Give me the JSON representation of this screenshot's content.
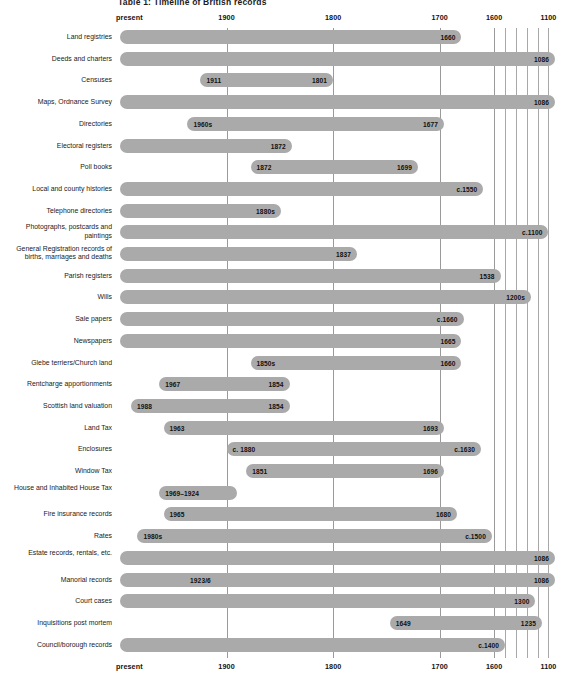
{
  "figure": {
    "title": "Table 1: Timeline of British records",
    "axis_labels_top": [
      "present",
      "1900",
      "1800",
      "1700",
      "1600",
      "1100"
    ],
    "axis_labels_bottom": [
      "present",
      "1900",
      "1800",
      "1700",
      "1600",
      "1100"
    ],
    "bar_color": "#aaaaaa",
    "gridline_color": "#9a9a9a"
  },
  "chart_data": {
    "type": "bar",
    "title": "Table 1: Timeline of British records",
    "xlabel": "",
    "ylabel": "",
    "orientation": "horizontal-timeline",
    "grid": true,
    "legend": "none",
    "axis_ticks": [
      {
        "label": "present",
        "pos": 0
      },
      {
        "label": "1900",
        "pos": 0.245
      },
      {
        "label": "1800",
        "pos": 0.49
      },
      {
        "label": "1700",
        "pos": 0.735
      },
      {
        "label": "1600",
        "pos": 0.86
      },
      {
        "label": "1100",
        "pos": 0.985
      }
    ],
    "minor_gridlines": [
      0.886,
      0.911,
      0.936,
      0.961,
      0.985
    ],
    "categories": [
      "Land registries",
      "Deeds and charters",
      "Censuses",
      "Maps, Ordnance Survey",
      "Directories",
      "Electoral registers",
      "Poll books",
      "Local and county histories",
      "Telephone directories",
      "Photographs, postcards and paintings",
      "General Registration records of births, marriages and deaths",
      "Parish registers",
      "Wills",
      "Sale papers",
      "Newspapers",
      "Glebe terriers/Church land",
      "Rentcharge apportionments",
      "Scottish land valuation",
      "Land Tax",
      "Enclosures",
      "Window Tax",
      "House and Inhabited House Tax",
      "Fire insurance records",
      "Rates",
      "Estate records, rentals, etc.",
      "Manorial records",
      "Court cases",
      "Inquisitions post mortem",
      "Council/borough records"
    ],
    "rows": [
      {
        "label": "Land registries",
        "start": 0.0,
        "end": 0.785,
        "start_value": "",
        "end_value": "1660"
      },
      {
        "label": "Deeds and charters",
        "start": 0.0,
        "end": 1.0,
        "start_value": "",
        "end_value": "1086"
      },
      {
        "label": "Censuses",
        "start": 0.185,
        "end": 0.49,
        "start_value": "1911",
        "end_value": "1801"
      },
      {
        "label": "Maps, Ordnance Survey",
        "start": 0.0,
        "end": 1.0,
        "start_value": "",
        "end_value": "1086"
      },
      {
        "label": "Directories",
        "start": 0.155,
        "end": 0.745,
        "start_value": "1960s",
        "end_value": "1677"
      },
      {
        "label": "Electoral registers",
        "start": 0.0,
        "end": 0.395,
        "start_value": "",
        "end_value": "1872"
      },
      {
        "label": "Poll books",
        "start": 0.3,
        "end": 0.685,
        "start_value": "1872",
        "end_value": "1699"
      },
      {
        "label": "Local and county histories",
        "start": 0.0,
        "end": 0.835,
        "start_value": "",
        "end_value": "c.1550"
      },
      {
        "label": "Telephone directories",
        "start": 0.0,
        "end": 0.37,
        "start_value": "",
        "end_value": "1880s"
      },
      {
        "label": "Photographs, postcards and paintings",
        "start": 0.0,
        "end": 0.985,
        "start_value": "",
        "end_value": "c.1100"
      },
      {
        "label": "General Registration records of births, marriages and deaths",
        "start": 0.0,
        "end": 0.545,
        "start_value": "",
        "end_value": "1837"
      },
      {
        "label": "Parish registers",
        "start": 0.0,
        "end": 0.875,
        "start_value": "",
        "end_value": "1538"
      },
      {
        "label": "Wills",
        "start": 0.0,
        "end": 0.945,
        "start_value": "",
        "end_value": "1200s"
      },
      {
        "label": "Sale papers",
        "start": 0.0,
        "end": 0.79,
        "start_value": "",
        "end_value": "c.1660"
      },
      {
        "label": "Newspapers",
        "start": 0.0,
        "end": 0.785,
        "start_value": "",
        "end_value": "1665"
      },
      {
        "label": "Glebe terriers/Church land",
        "start": 0.3,
        "end": 0.785,
        "start_value": "1850s",
        "end_value": "1660"
      },
      {
        "label": "Rentcharge apportionments",
        "start": 0.09,
        "end": 0.39,
        "start_value": "1967",
        "end_value": "1854"
      },
      {
        "label": "Scottish land valuation",
        "start": 0.025,
        "end": 0.39,
        "start_value": "1988",
        "end_value": "1854"
      },
      {
        "label": "Land Tax",
        "start": 0.1,
        "end": 0.745,
        "start_value": "1963",
        "end_value": "1693"
      },
      {
        "label": "Enclosures",
        "start": 0.245,
        "end": 0.83,
        "start_value": "c. 1880",
        "end_value": "c.1630"
      },
      {
        "label": "Window Tax",
        "start": 0.29,
        "end": 0.745,
        "start_value": "1851",
        "end_value": "1696"
      },
      {
        "label": "House and Inhabited House Tax",
        "start": 0.09,
        "end": 0.27,
        "start_value": "1969–1924",
        "end_value": ""
      },
      {
        "label": "Fire insurance records",
        "start": 0.1,
        "end": 0.775,
        "start_value": "1965",
        "end_value": "1680"
      },
      {
        "label": "Rates",
        "start": 0.04,
        "end": 0.855,
        "start_value": "1980s",
        "end_value": "c.1500"
      },
      {
        "label": "Estate records, rentals, etc.",
        "start": 0.0,
        "end": 1.0,
        "start_value": "",
        "end_value": "1086"
      },
      {
        "label": "Manorial records",
        "start": 0.0,
        "end": 1.0,
        "start_value": "1923/6",
        "end_value": "1086",
        "value_pos": 0.185
      },
      {
        "label": "Court cases",
        "start": 0.0,
        "end": 0.955,
        "start_value": "",
        "end_value": "1300"
      },
      {
        "label": "Inquisitions post mortem",
        "start": 0.62,
        "end": 0.97,
        "start_value": "1649",
        "end_value": "1235"
      },
      {
        "label": "Council/borough records",
        "start": 0.0,
        "end": 0.885,
        "start_value": "",
        "end_value": "c.1400"
      }
    ]
  }
}
